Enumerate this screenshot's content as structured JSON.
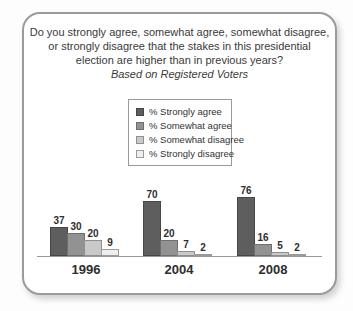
{
  "header": {
    "title_lines": [
      "Do you strongly agree, somewhat agree, somewhat disagree,",
      "or strongly disagree that the stakes in this presidential",
      "election are higher than in previous years?"
    ],
    "subtitle": "Based on Registered Voters"
  },
  "legend": {
    "items": [
      {
        "label": "% Strongly agree",
        "color": "#5e5e5e",
        "border": "#464646"
      },
      {
        "label": "% Somewhat agree",
        "color": "#929292",
        "border": "#6e6e6e"
      },
      {
        "label": "% Somewhat disagree",
        "color": "#c9c9c9",
        "border": "#8f8f8f"
      },
      {
        "label": "% Strongly disagree",
        "color": "#efefef",
        "border": "#9a9a9a"
      }
    ]
  },
  "chart_data": {
    "type": "bar",
    "title": "Do you strongly agree, somewhat agree, somewhat disagree, or strongly disagree that the stakes in this presidential election are higher than in previous years?",
    "subtitle": "Based on Registered Voters",
    "categories": [
      "1996",
      "2004",
      "2008"
    ],
    "series": [
      {
        "name": "% Strongly agree",
        "fill": "#5e5e5e",
        "border": "#464646",
        "values": [
          37,
          70,
          76
        ]
      },
      {
        "name": "% Somewhat agree",
        "fill": "#929292",
        "border": "#6e6e6e",
        "values": [
          30,
          20,
          16
        ]
      },
      {
        "name": "% Somewhat disagree",
        "fill": "#c9c9c9",
        "border": "#8f8f8f",
        "values": [
          20,
          7,
          5
        ]
      },
      {
        "name": "% Strongly disagree",
        "fill": "#efefef",
        "border": "#9a9a9a",
        "values": [
          9,
          2,
          2
        ]
      }
    ],
    "xlabel": "",
    "ylabel": "",
    "ylim": [
      0,
      100
    ],
    "grid": false,
    "legend_position": "top-center",
    "value_labels": true,
    "axis_line_color": "#999999"
  }
}
